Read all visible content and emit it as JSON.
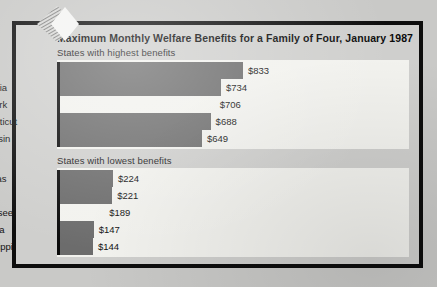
{
  "chart_data": {
    "type": "bar",
    "orientation": "horizontal",
    "title": "Maximum Monthly Welfare Benefits for a Family of Four, January 1987",
    "xlabel": "",
    "ylabel": "",
    "value_prefix": "$",
    "grid": false,
    "legend": false,
    "groups": [
      {
        "heading": "States with highest benefits",
        "axis_max": 833,
        "categories": [
          "Alaska",
          "California",
          "New York",
          "Connecticut",
          "Wisconsin"
        ],
        "values": [
          833,
          734,
          706,
          688,
          649
        ],
        "value_labels": [
          "$833",
          "$734",
          "$706",
          "$688",
          "$649"
        ],
        "bar_styles": [
          "filled",
          "filled",
          "blank",
          "filled",
          "filled"
        ]
      },
      {
        "heading": "States with lowest benefits",
        "axis_max": 224,
        "categories": [
          "Arkansas",
          "Texas",
          "Tennessee",
          "Alabama",
          "Mississippi"
        ],
        "values": [
          224,
          221,
          189,
          147,
          144
        ],
        "value_labels": [
          "$224",
          "$221",
          "$189",
          "$147",
          "$144"
        ],
        "bar_styles": [
          "filled",
          "filled",
          "blank",
          "filled",
          "filled"
        ]
      }
    ]
  },
  "colors": {
    "page_background": "#c9c9c7",
    "frame": "#0d0d0d",
    "panel": "#f2f2ee",
    "bar_fill": "#6c6c6c",
    "baseline": "#0a0a0a",
    "text": "#111111"
  },
  "ornament": {
    "name": "diamond-hatch-ornament"
  }
}
